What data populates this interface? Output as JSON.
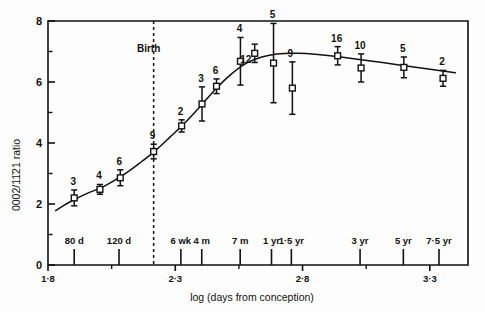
{
  "chart_data": {
    "type": "line",
    "title": "",
    "xlabel": "log (days from conception)",
    "ylabel": "0002/11̅2̅1 ratio",
    "ylabel_plain": "0002/1121 ratio",
    "xlim": [
      1.8,
      3.45
    ],
    "ylim": [
      0,
      8
    ],
    "grid": false,
    "legend": false,
    "y_ticks_major": [
      "0",
      "2",
      "4",
      "6",
      "8"
    ],
    "y_ticks_major_values": [
      0,
      2,
      4,
      6,
      8
    ],
    "y_ticks_minor_values": [
      1,
      3,
      5,
      7
    ],
    "x_ticks_major": [
      "1·8",
      "2·3",
      "2·8",
      "3·3"
    ],
    "x_ticks_major_values": [
      1.8,
      2.3,
      2.8,
      3.3
    ],
    "x_ticks_minor_values": [
      2.05,
      2.55,
      3.05
    ],
    "age_ticks": [
      {
        "label": "80 d",
        "x": 1.903
      },
      {
        "label": "120 d",
        "x": 2.079
      },
      {
        "label": "6 wk",
        "x": 2.322
      },
      {
        "label": "4 m",
        "x": 2.404
      },
      {
        "label": "7 m",
        "x": 2.555
      },
      {
        "label": "1 yr",
        "x": 2.678
      },
      {
        "label": "1·5 yr",
        "x": 2.756
      },
      {
        "label": "3 yr",
        "x": 3.026
      },
      {
        "label": "5 yr",
        "x": 3.196
      },
      {
        "label": "7·5 yr",
        "x": 3.336
      }
    ],
    "annotations": [
      {
        "name": "birth-line",
        "label": "Birth",
        "x": 2.215,
        "style": "dashed-vertical"
      }
    ],
    "series": [
      {
        "name": "0002/1121 ratio",
        "marker": "open-square",
        "points": [
          {
            "n": "3",
            "x": 1.903,
            "y": 2.2,
            "err": 0.26
          },
          {
            "n": "4",
            "x": 2.004,
            "y": 2.48,
            "err": 0.16
          },
          {
            "n": "6",
            "x": 2.084,
            "y": 2.86,
            "err": 0.26
          },
          {
            "n": "9",
            "x": 2.215,
            "y": 3.72,
            "err": 0.24
          },
          {
            "n": "2",
            "x": 2.325,
            "y": 4.56,
            "err": 0.2
          },
          {
            "n": "3",
            "x": 2.405,
            "y": 5.28,
            "err": 0.56
          },
          {
            "n": "6",
            "x": 2.462,
            "y": 5.86,
            "err": 0.24
          },
          {
            "n": "4",
            "x": 2.556,
            "y": 6.68,
            "err": 0.78
          },
          {
            "n": "12",
            "x": 2.612,
            "y": 6.94,
            "err": 0.3
          },
          {
            "n": "5",
            "x": 2.686,
            "y": 6.62,
            "err": 1.3
          },
          {
            "n": "9",
            "x": 2.76,
            "y": 5.8,
            "err": 0.86
          },
          {
            "n": "16",
            "x": 2.938,
            "y": 6.86,
            "err": 0.3
          },
          {
            "n": "10",
            "x": 3.03,
            "y": 6.46,
            "err": 0.46
          },
          {
            "n": "5",
            "x": 3.198,
            "y": 6.48,
            "err": 0.34
          },
          {
            "n": "2",
            "x": 3.352,
            "y": 6.12,
            "err": 0.26
          }
        ]
      }
    ],
    "fitted_curve": [
      {
        "x": 1.83,
        "y": 1.78
      },
      {
        "x": 1.88,
        "y": 2.04
      },
      {
        "x": 1.95,
        "y": 2.33
      },
      {
        "x": 2.02,
        "y": 2.58
      },
      {
        "x": 2.09,
        "y": 2.92
      },
      {
        "x": 2.16,
        "y": 3.34
      },
      {
        "x": 2.215,
        "y": 3.7
      },
      {
        "x": 2.28,
        "y": 4.2
      },
      {
        "x": 2.34,
        "y": 4.68
      },
      {
        "x": 2.4,
        "y": 5.22
      },
      {
        "x": 2.46,
        "y": 5.78
      },
      {
        "x": 2.52,
        "y": 6.26
      },
      {
        "x": 2.58,
        "y": 6.62
      },
      {
        "x": 2.64,
        "y": 6.82
      },
      {
        "x": 2.7,
        "y": 6.92
      },
      {
        "x": 2.78,
        "y": 6.94
      },
      {
        "x": 2.86,
        "y": 6.9
      },
      {
        "x": 2.95,
        "y": 6.82
      },
      {
        "x": 3.06,
        "y": 6.7
      },
      {
        "x": 3.18,
        "y": 6.56
      },
      {
        "x": 3.28,
        "y": 6.44
      },
      {
        "x": 3.4,
        "y": 6.3
      }
    ]
  }
}
